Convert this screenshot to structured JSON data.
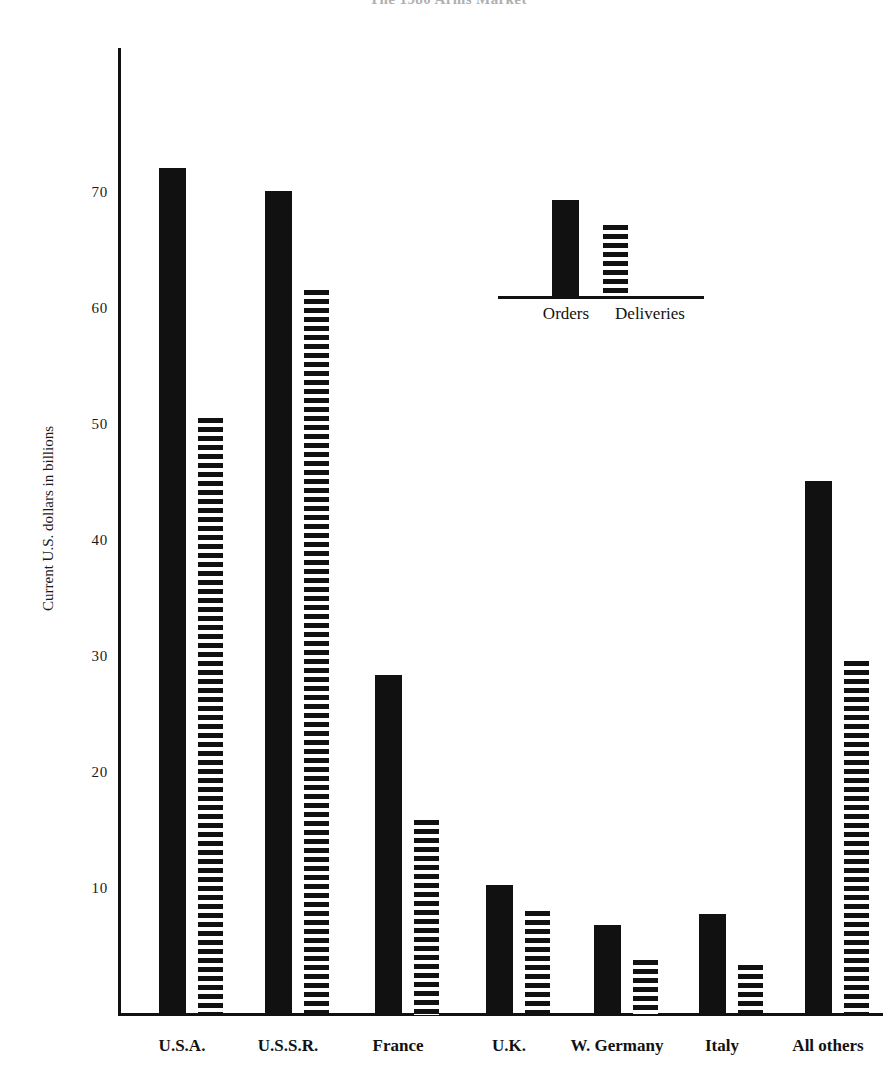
{
  "chart_data": {
    "type": "bar",
    "title": "The 1980 Arms Market",
    "title_cropped": true,
    "xlabel": "",
    "ylabel": "Current U.S. dollars in billions",
    "ylim": [
      0,
      78
    ],
    "yticks": [
      10,
      20,
      30,
      40,
      50,
      60,
      70
    ],
    "ytick_labels": [
      "10",
      "20",
      "30",
      "40",
      "50",
      "60",
      "70"
    ],
    "grid": false,
    "legend_position": "inside-upper-center",
    "categories": [
      "U.S.A.",
      "U.S.S.R.",
      "France",
      "U.K.",
      "W. Germany",
      "Italy",
      "All others"
    ],
    "series": [
      {
        "name": "Orders",
        "fill": "solid-black",
        "color": "#111111",
        "values": [
          73.0,
          71.0,
          29.3,
          11.2,
          7.8,
          8.7,
          46.0
        ]
      },
      {
        "name": "Deliveries",
        "fill": "horizontal-stripes",
        "color": "#111111",
        "values": [
          51.5,
          62.5,
          16.8,
          9.0,
          4.7,
          4.3,
          30.5
        ]
      }
    ]
  },
  "axis": {
    "y_title": "Current U.S. dollars in billions",
    "tick_labels": [
      "70",
      "60",
      "50",
      "40",
      "30",
      "20",
      "10"
    ]
  },
  "legend": {
    "orders_label": "Orders",
    "deliveries_label": "Deliveries"
  },
  "colors": {
    "ink": "#111111",
    "paper": "#ffffff"
  }
}
